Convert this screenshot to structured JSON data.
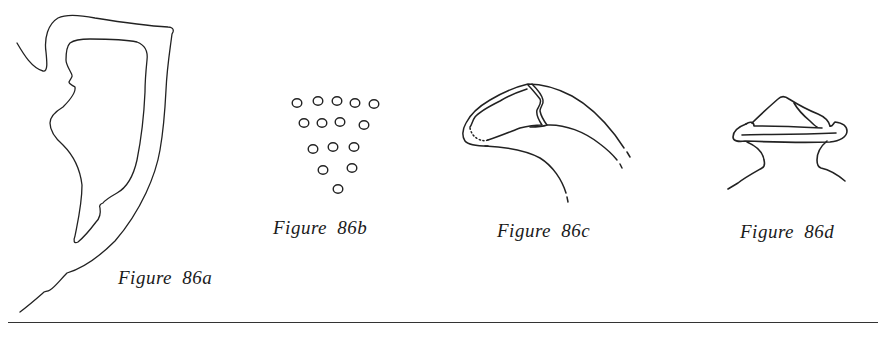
{
  "figures": [
    {
      "id": "86a",
      "caption": "Figure 86a",
      "subject": "hooked-outline-drawing"
    },
    {
      "id": "86b",
      "caption": "Figure 86b",
      "subject": "triangular-dot-array",
      "dot_rows": [
        5,
        4,
        3,
        2,
        1
      ]
    },
    {
      "id": "86c",
      "caption": "Figure 86c",
      "subject": "curved-claw-drawing"
    },
    {
      "id": "86d",
      "caption": "Figure 86d",
      "subject": "capped-neck-drawing"
    }
  ],
  "colors": {
    "ink": "#222222",
    "background": "#ffffff"
  }
}
